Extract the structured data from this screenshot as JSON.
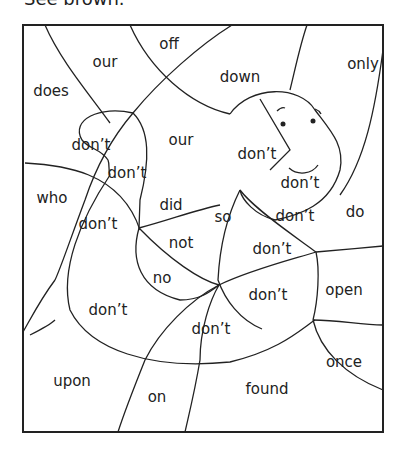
{
  "title": "See brown.",
  "words": [
    {
      "text": "off",
      "x": 169,
      "y": 44
    },
    {
      "text": "our",
      "x": 105,
      "y": 62
    },
    {
      "text": "only",
      "x": 363,
      "y": 64
    },
    {
      "text": "does",
      "x": 51,
      "y": 91
    },
    {
      "text": "down",
      "x": 240,
      "y": 77
    },
    {
      "text": "our",
      "x": 181,
      "y": 140
    },
    {
      "text": "don’t",
      "x": 91,
      "y": 145
    },
    {
      "text": "don’t",
      "x": 257,
      "y": 154
    },
    {
      "text": "don’t",
      "x": 127,
      "y": 173
    },
    {
      "text": "don’t",
      "x": 300,
      "y": 183
    },
    {
      "text": "who",
      "x": 52,
      "y": 198
    },
    {
      "text": "did",
      "x": 171,
      "y": 205
    },
    {
      "text": "so",
      "x": 223,
      "y": 217
    },
    {
      "text": "don’t",
      "x": 295,
      "y": 216
    },
    {
      "text": "do",
      "x": 355,
      "y": 212
    },
    {
      "text": "don’t",
      "x": 98,
      "y": 224
    },
    {
      "text": "not",
      "x": 181,
      "y": 243
    },
    {
      "text": "don’t",
      "x": 272,
      "y": 249
    },
    {
      "text": "no",
      "x": 162,
      "y": 278
    },
    {
      "text": "don’t",
      "x": 268,
      "y": 295
    },
    {
      "text": "open",
      "x": 344,
      "y": 290
    },
    {
      "text": "don’t",
      "x": 108,
      "y": 310
    },
    {
      "text": "don’t",
      "x": 211,
      "y": 329
    },
    {
      "text": "once",
      "x": 344,
      "y": 362
    },
    {
      "text": "upon",
      "x": 72,
      "y": 381
    },
    {
      "text": "found",
      "x": 267,
      "y": 389
    },
    {
      "text": "on",
      "x": 157,
      "y": 397
    }
  ]
}
